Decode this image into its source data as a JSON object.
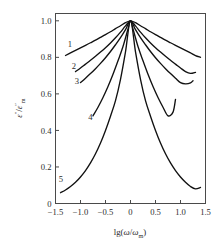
{
  "chart_data": {
    "type": "line",
    "title": "",
    "xlabel": "lg(ω/ωm)",
    "ylabel": "ε″/ε″m",
    "xlim": [
      -1.5,
      1.5
    ],
    "ylim": [
      0,
      1.04
    ],
    "grid": false,
    "legend": "inline-curve-numbers",
    "xticks": [
      -1.5,
      -1.0,
      -0.5,
      0,
      0.5,
      1.0,
      1.5
    ],
    "xticklabels": [
      "−1.5",
      "−1.0",
      "−0.5",
      "0",
      "0.5",
      "1.0",
      "1.5"
    ],
    "yticks": [
      0,
      0.2,
      0.4,
      0.6,
      0.8,
      1.0
    ],
    "yticklabels": [
      "0",
      "0.2",
      "0.4",
      "0.6",
      "0.8",
      "1.0"
    ],
    "series": [
      {
        "name": "1",
        "label": "1",
        "label_x": -1.21,
        "label_y": 0.855,
        "alpha": 0.22,
        "x": [
          -1.3,
          -1.2,
          -1.1,
          -1.0,
          -0.9,
          -0.8,
          -0.7,
          -0.6,
          -0.5,
          -0.4,
          -0.3,
          -0.2,
          -0.1,
          0.0,
          0.1,
          0.2,
          0.3,
          0.4,
          0.5,
          0.6,
          0.7,
          0.8,
          0.9,
          1.0,
          1.1,
          1.2,
          1.3,
          1.4
        ],
        "y": [
          0.81,
          0.824,
          0.838,
          0.852,
          0.866,
          0.88,
          0.894,
          0.909,
          0.924,
          0.94,
          0.957,
          0.973,
          0.99,
          1.0,
          0.99,
          0.973,
          0.957,
          0.94,
          0.924,
          0.909,
          0.894,
          0.88,
          0.866,
          0.852,
          0.838,
          0.824,
          0.81,
          0.8
        ]
      },
      {
        "name": "2",
        "label": "2",
        "label_x": -1.13,
        "label_y": 0.735,
        "alpha": 0.33,
        "x": [
          -1.1,
          -1.0,
          -0.9,
          -0.8,
          -0.7,
          -0.6,
          -0.5,
          -0.4,
          -0.3,
          -0.2,
          -0.1,
          0.0,
          0.1,
          0.2,
          0.3,
          0.4,
          0.5,
          0.6,
          0.7,
          0.8,
          0.9,
          1.0,
          1.1,
          1.2,
          1.3
        ],
        "y": [
          0.722,
          0.742,
          0.763,
          0.784,
          0.806,
          0.829,
          0.853,
          0.879,
          0.907,
          0.938,
          0.972,
          1.0,
          0.972,
          0.938,
          0.907,
          0.879,
          0.853,
          0.829,
          0.806,
          0.784,
          0.763,
          0.742,
          0.722,
          0.712,
          0.718
        ]
      },
      {
        "name": "3",
        "label": "3",
        "label_x": -1.07,
        "label_y": 0.655,
        "alpha": 0.42,
        "x": [
          -1.0,
          -0.9,
          -0.8,
          -0.7,
          -0.6,
          -0.5,
          -0.4,
          -0.3,
          -0.2,
          -0.1,
          0.0,
          0.1,
          0.2,
          0.3,
          0.4,
          0.5,
          0.6,
          0.7,
          0.8,
          0.9,
          1.0,
          1.1,
          1.2,
          1.25
        ],
        "y": [
          0.662,
          0.686,
          0.711,
          0.738,
          0.767,
          0.798,
          0.832,
          0.869,
          0.908,
          0.952,
          1.0,
          0.952,
          0.908,
          0.869,
          0.832,
          0.798,
          0.767,
          0.738,
          0.711,
          0.686,
          0.662,
          0.655,
          0.66,
          0.672
        ]
      },
      {
        "name": "4",
        "label": "4",
        "label_x": -0.8,
        "label_y": 0.455,
        "alpha": 0.66,
        "x": [
          -0.75,
          -0.65,
          -0.55,
          -0.45,
          -0.35,
          -0.25,
          -0.15,
          -0.05,
          0.0,
          0.05,
          0.15,
          0.25,
          0.35,
          0.45,
          0.55,
          0.65,
          0.75,
          0.85,
          0.9
        ],
        "y": [
          0.48,
          0.527,
          0.58,
          0.64,
          0.707,
          0.781,
          0.859,
          0.955,
          1.0,
          0.955,
          0.859,
          0.781,
          0.707,
          0.64,
          0.58,
          0.527,
          0.48,
          0.5,
          0.57
        ]
      },
      {
        "name": "5",
        "label": "5",
        "label_x": -1.39,
        "label_y": 0.118,
        "alpha": 0.98,
        "x": [
          -1.4,
          -1.3,
          -1.2,
          -1.1,
          -1.0,
          -0.9,
          -0.8,
          -0.7,
          -0.6,
          -0.5,
          -0.4,
          -0.3,
          -0.2,
          -0.1,
          0.0,
          0.1,
          0.2,
          0.3,
          0.4,
          0.5,
          0.6,
          0.7,
          0.8,
          0.9,
          1.0,
          1.1,
          1.2,
          1.3,
          1.4
        ],
        "y": [
          0.059,
          0.074,
          0.093,
          0.116,
          0.145,
          0.18,
          0.222,
          0.272,
          0.331,
          0.4,
          0.478,
          0.563,
          0.68,
          0.83,
          1.0,
          0.83,
          0.68,
          0.563,
          0.478,
          0.4,
          0.331,
          0.272,
          0.222,
          0.18,
          0.145,
          0.116,
          0.093,
          0.08,
          0.088
        ]
      }
    ]
  },
  "axis": {
    "ylabel_parts": {
      "eps": "ε",
      "prime2": "″",
      "slash": "/",
      "eps2": "ε",
      "sub_m": "m"
    },
    "xlabel_parts": {
      "lg": "lg(",
      "omega": "ω",
      "slash": "/",
      "omega2": "ω",
      "sub_m": "m",
      "close": ")"
    }
  },
  "colors": {
    "curve": "#111111",
    "frame": "#4a4a4a",
    "text": "#2b2b2b",
    "background": "#ffffff"
  }
}
